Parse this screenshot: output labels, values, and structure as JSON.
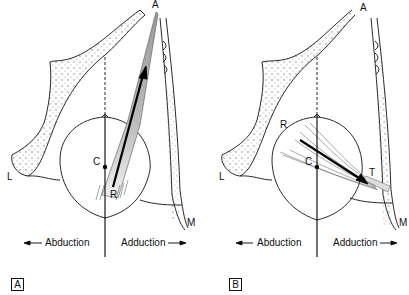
{
  "panels": [
    {
      "id": "A",
      "tag": "A",
      "labels": {
        "top": "A",
        "center": "C",
        "insertion": "R",
        "lateral": "L",
        "medial": "M"
      },
      "direction_left": "Abduction",
      "direction_right": "Adduction"
    },
    {
      "id": "B",
      "tag": "B",
      "labels": {
        "top": "A",
        "center": "C",
        "insertion": "R",
        "tendon": "T",
        "lateral": "L",
        "medial": "M"
      },
      "direction_left": "Abduction",
      "direction_right": "Adduction"
    }
  ],
  "colors": {
    "line": "#111111",
    "muscle_dark": "#8a8a8a",
    "muscle_light": "#e6e6e6",
    "background": "#ffffff"
  }
}
